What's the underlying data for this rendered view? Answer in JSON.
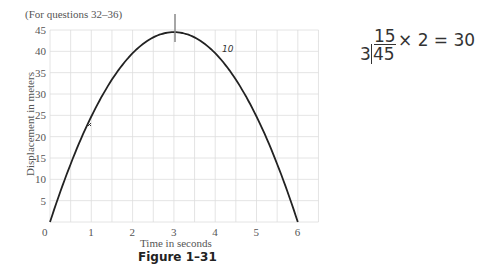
{
  "header": {
    "note": "(For questions 32–36)"
  },
  "figure": {
    "caption": "Figure 1–31"
  },
  "chart_data": {
    "type": "line",
    "title": "",
    "xlabel": "Time in seconds",
    "ylabel": "Displacement in meters",
    "x_ticks": [
      0,
      1,
      2,
      3,
      4,
      5,
      6
    ],
    "y_ticks": [
      0,
      5,
      10,
      15,
      20,
      25,
      30,
      35,
      40,
      45
    ],
    "xlim": [
      0,
      6.5
    ],
    "ylim": [
      0,
      45
    ],
    "grid": true,
    "series": [
      {
        "name": "displacement",
        "x": [
          0,
          0.5,
          1,
          1.5,
          2,
          2.5,
          3,
          3.5,
          4,
          4.5,
          5,
          5.5,
          6
        ],
        "values": [
          0,
          12.4,
          22.2,
          30,
          36,
          40,
          44.5,
          40,
          36,
          30,
          22.2,
          12.4,
          0
        ]
      }
    ]
  },
  "annotations": {
    "handwritten_margin": "10",
    "handwritten_work_quotient": "15",
    "handwritten_work_divisor": "3",
    "handwritten_work_dividend": "45",
    "handwritten_work_rest": "× 2 = 30"
  }
}
